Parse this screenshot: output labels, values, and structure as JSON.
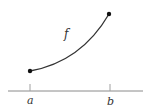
{
  "diagram": {
    "function_label": "f",
    "left_endpoint_label": "a",
    "right_endpoint_label": "b",
    "colors": {
      "curve": "#333333",
      "axis": "#888888",
      "tick": "#999999",
      "text": "#333333",
      "background": "#ffffff"
    }
  }
}
